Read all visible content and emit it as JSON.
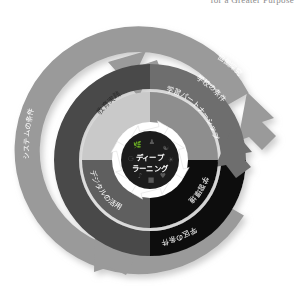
{
  "page_header": {
    "fragment_text": "for a Greater Purpose"
  },
  "diagram": {
    "name": "deep-learning-concentric-cycle-diagram",
    "core": {
      "line1": "ディープ",
      "line2": "ラーニング",
      "icons": [
        "leaf-icon",
        "people-icon",
        "handshake-icon",
        "lightbulb-icon",
        "music-note-icon",
        "heart-icon",
        "globe-icon",
        "book-icon"
      ]
    },
    "inner_ring": {
      "quadrants": [
        {
          "label": "教育実践",
          "position": "top-left",
          "color": "#c9c9c9"
        },
        {
          "label": "学習パートナーシップ",
          "position": "top-right",
          "color": "#8e8e8e"
        },
        {
          "label": "デジタルの活用",
          "position": "bottom-left",
          "color": "#5e5e5e"
        },
        {
          "label": "学習環境",
          "position": "bottom-right",
          "color": "#111111"
        }
      ]
    },
    "middle_ring": {
      "segments": [
        {
          "label": "学校の条件",
          "position": "upper-right",
          "color": "#6e6e6e"
        },
        {
          "label": "学区の条件",
          "position": "lower-right",
          "color": "#111111"
        }
      ],
      "color_left": "#4a4a4a"
    },
    "outer_ring": {
      "segments": [
        {
          "label": "協働探究",
          "position": "top-right",
          "color": "#9a9a9a"
        },
        {
          "label": "システムの条件",
          "position": "left",
          "color": "#9a9a9a"
        }
      ],
      "color": "#9a9a9a"
    },
    "arrows": {
      "count": 4,
      "direction": "counter-clockwise",
      "names": [
        "outer-arrow-top-left",
        "outer-arrow-bottom-left",
        "middle-arrow-right",
        "inner-arrow-set"
      ]
    },
    "colors": {
      "outer_ring": "#9a9a9a",
      "middle_ring_dark": "#4a4a4a",
      "middle_ring_black": "#111111",
      "inner_light": "#c9c9c9",
      "inner_medium": "#8e8e8e",
      "inner_dark": "#5e5e5e",
      "inner_black": "#111111",
      "core": "#1c1c1c",
      "gap": "#ffffff",
      "shadow": "#d8d8d8"
    }
  }
}
